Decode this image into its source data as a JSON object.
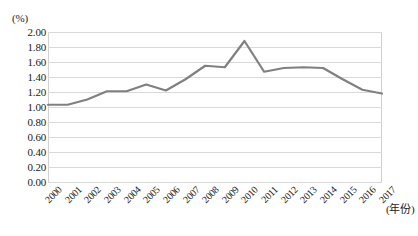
{
  "chart_data": {
    "type": "line",
    "title": "",
    "subtitle": "",
    "xlabel": "(年份)",
    "ylabel": "(%)",
    "categories": [
      "2000",
      "2001",
      "2002",
      "2003",
      "2004",
      "2005",
      "2006",
      "2007",
      "2008",
      "2009",
      "2010",
      "2011",
      "2012",
      "2013",
      "2014",
      "2015",
      "2016",
      "2017"
    ],
    "x": [
      2000,
      2001,
      2002,
      2003,
      2004,
      2005,
      2006,
      2007,
      2008,
      2009,
      2010,
      2011,
      2012,
      2013,
      2014,
      2015,
      2016,
      2017
    ],
    "values": [
      1.03,
      1.03,
      1.1,
      1.21,
      1.21,
      1.3,
      1.22,
      1.37,
      1.55,
      1.53,
      1.88,
      1.47,
      1.52,
      1.53,
      1.52,
      1.37,
      1.23,
      1.18
    ],
    "series": [
      {
        "name": "",
        "color": "#808080",
        "values": [
          1.03,
          1.03,
          1.1,
          1.21,
          1.21,
          1.3,
          1.22,
          1.37,
          1.55,
          1.53,
          1.88,
          1.47,
          1.52,
          1.53,
          1.52,
          1.37,
          1.23,
          1.18
        ]
      }
    ],
    "ylim": [
      0.0,
      2.0
    ],
    "ytick_step": 0.2,
    "yticks": [
      "2.00",
      "1.80",
      "1.60",
      "1.40",
      "1.20",
      "1.00",
      "0.80",
      "0.60",
      "0.40",
      "0.20",
      "0.00"
    ],
    "ytick_values": [
      2.0,
      1.8,
      1.6,
      1.4,
      1.2,
      1.0,
      0.8,
      0.6,
      0.4,
      0.2,
      0.0
    ],
    "grid": "horizontal",
    "legend": "none",
    "annotations": [],
    "line_color": "#808080",
    "gridline_color": "#d9d9d9",
    "background": "#ffffff"
  }
}
